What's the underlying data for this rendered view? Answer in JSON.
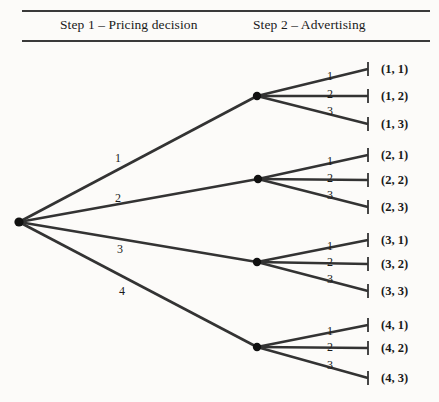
{
  "header": {
    "step1": "Step 1 – Pricing decision",
    "step2": "Step 2 – Advertising"
  },
  "tree": {
    "root": {
      "x": 19,
      "y": 222
    },
    "leaf_tick_x": 368,
    "stage1_labels": [
      "1",
      "2",
      "3",
      "4"
    ],
    "stage2_labels": [
      "1",
      "2",
      "3"
    ],
    "branches": [
      {
        "stage1_label": "1",
        "stage1_label_pos": {
          "x": 118,
          "y": 152
        },
        "node": {
          "x": 257,
          "y": 96
        },
        "leaves": [
          {
            "label": "(1, 1)",
            "y": 69,
            "branch_label": "1",
            "branch_label_pos": {
              "x": 330,
              "y": 70
            }
          },
          {
            "label": "(1, 2)",
            "y": 96,
            "branch_label": "2",
            "branch_label_pos": {
              "x": 330,
              "y": 88
            }
          },
          {
            "label": "(1, 3)",
            "y": 124,
            "branch_label": "3",
            "branch_label_pos": {
              "x": 330,
              "y": 105
            }
          }
        ]
      },
      {
        "stage1_label": "2",
        "stage1_label_pos": {
          "x": 118,
          "y": 192
        },
        "node": {
          "x": 258,
          "y": 179
        },
        "leaves": [
          {
            "label": "(2, 1)",
            "y": 155,
            "branch_label": "1",
            "branch_label_pos": {
              "x": 330,
              "y": 155
            }
          },
          {
            "label": "(2, 2)",
            "y": 180,
            "branch_label": "2",
            "branch_label_pos": {
              "x": 330,
              "y": 172
            }
          },
          {
            "label": "(2, 3)",
            "y": 207,
            "branch_label": "3",
            "branch_label_pos": {
              "x": 330,
              "y": 189
            }
          }
        ]
      },
      {
        "stage1_label": "3",
        "stage1_label_pos": {
          "x": 120,
          "y": 243
        },
        "node": {
          "x": 257,
          "y": 262
        },
        "leaves": [
          {
            "label": "(3, 1)",
            "y": 240,
            "branch_label": "1",
            "branch_label_pos": {
              "x": 330,
              "y": 240
            }
          },
          {
            "label": "(3, 2)",
            "y": 264,
            "branch_label": "2",
            "branch_label_pos": {
              "x": 330,
              "y": 256
            }
          },
          {
            "label": "(3, 3)",
            "y": 291,
            "branch_label": "3",
            "branch_label_pos": {
              "x": 330,
              "y": 273
            }
          }
        ]
      },
      {
        "stage1_label": "4",
        "stage1_label_pos": {
          "x": 122,
          "y": 285
        },
        "node": {
          "x": 257,
          "y": 347
        },
        "leaves": [
          {
            "label": "(4, 1)",
            "y": 325,
            "branch_label": "1",
            "branch_label_pos": {
              "x": 330,
              "y": 325
            }
          },
          {
            "label": "(4, 2)",
            "y": 348,
            "branch_label": "2",
            "branch_label_pos": {
              "x": 330,
              "y": 341
            }
          },
          {
            "label": "(4, 3)",
            "y": 378,
            "branch_label": "3",
            "branch_label_pos": {
              "x": 330,
              "y": 359
            }
          }
        ]
      }
    ]
  },
  "style": {
    "line_color": "#333333",
    "node_color": "#111111"
  }
}
